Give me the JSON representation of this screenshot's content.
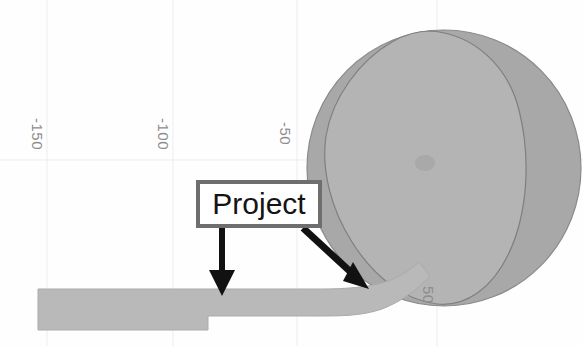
{
  "figure": {
    "kind": "scanned-engineering-diagram",
    "background_color": "#fefefe",
    "width_px": 583,
    "height_px": 346
  },
  "axis": {
    "orientation": "rotated-vertical-labels",
    "tick_label_color": "#8d8d8d",
    "gridline_color": "#ededed",
    "ticks": [
      {
        "label": "-150",
        "x_px": 46,
        "y_px": 118
      },
      {
        "label": "-100",
        "x_px": 172,
        "y_px": 118
      },
      {
        "label": "-50",
        "x_px": 294,
        "y_px": 122
      },
      {
        "label": "50",
        "x_px": 437,
        "y_px": 286
      }
    ]
  },
  "callout": {
    "label": "Project",
    "box": {
      "x_px": 196,
      "y_px": 180,
      "width_px": 126,
      "height_px": 48
    },
    "border_color": "#6e6e6e",
    "fill_color": "#ffffff",
    "text_color": "#141414",
    "arrows": [
      {
        "name": "arrow-down-to-bar",
        "direction": "down",
        "from": {
          "x_px": 222,
          "y_px": 228
        },
        "to": {
          "x_px": 222,
          "y_px": 294
        },
        "color": "#111111"
      },
      {
        "name": "arrow-diagonal-to-notch",
        "direction": "down-right",
        "from": {
          "x_px": 305,
          "y_px": 229
        },
        "to": {
          "x_px": 366,
          "y_px": 286
        },
        "color": "#111111"
      }
    ]
  },
  "shapes": {
    "outer_disc": {
      "name": "outer-disc",
      "fill_color": "#a8a8a8",
      "stroke_color": "#8a8a8a",
      "center": {
        "x_px": 444,
        "y_px": 168
      },
      "radius_x_px": 137,
      "radius_y_px": 138
    },
    "inner_lobe": {
      "name": "inner-lobe",
      "fill_color": "#b4b4b4",
      "stroke_color": "#7f7f7f",
      "description": "teardrop lobe overlapping the disc, apex toward upper-left"
    },
    "lobe_mark": {
      "name": "lobe-center-mark",
      "fill_color": "#a5a5a5",
      "x_px": 425,
      "y_px": 163
    },
    "stepped_bar": {
      "name": "stepped-bar",
      "fill_color": "#b9b9b9",
      "stroke_color": "#ababab",
      "description": "thick horizontal bar at left that steps thinner, then sweeps up into the disc on the right",
      "left_x_px": 38,
      "top_y_px": 289,
      "step_x_px": 208,
      "thick_bottom_y_px": 330,
      "thin_bottom_y_px": 315
    }
  }
}
